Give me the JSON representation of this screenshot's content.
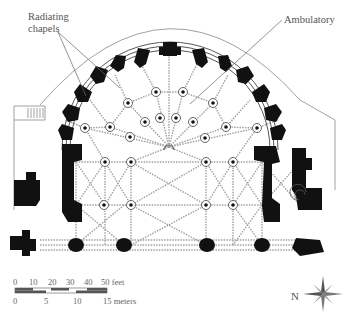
{
  "diagram": {
    "type": "architectural-floor-plan",
    "labels": {
      "radiating_chapels_line1": "Radiating",
      "radiating_chapels_line2": "chapels",
      "ambulatory": "Ambulatory"
    },
    "scale_bar": {
      "feet_ticks": [
        "0",
        "10",
        "20",
        "30",
        "40",
        "50 feet"
      ],
      "meter_ticks": [
        "0",
        "5",
        "10",
        "15 meters"
      ]
    },
    "compass": {
      "label": "N"
    },
    "colors": {
      "walls": "#111111",
      "vault_lines": "#9a9a9a",
      "outline": "#777777",
      "text": "#555555"
    }
  }
}
